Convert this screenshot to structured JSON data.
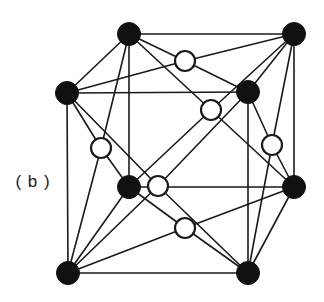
{
  "figure": {
    "panel_label": "( b )",
    "caption_text": "",
    "colors": {
      "background": "#ffffff",
      "line": "#1a1a1a",
      "filled_atom_fill": "#111111",
      "filled_atom_stroke": "#111111",
      "open_atom_fill": "#ffffff",
      "open_atom_stroke": "#1a1a1a",
      "label_color": "#1a1a1a"
    },
    "geometry": {
      "edge_stroke_width": 1.6,
      "filled_atom_radius": 11.5,
      "open_atom_radius": 10,
      "open_atom_stroke_width": 2.2
    }
  },
  "chart_data": {
    "type": "scatter",
    "title": "( b )",
    "xlabel": "",
    "ylabel": "",
    "grid": false,
    "legend": null,
    "structure": "face-centred cubic (fcc) unit cell",
    "projection": "oblique / cabinet projection of a cube",
    "atom_series": [
      {
        "name": "corner-atoms-filled",
        "marker": "filled-circle",
        "color": "#111111",
        "radius": 11.5,
        "count": 8,
        "points": [
          {
            "id": "corner-back-top-left",
            "x": 129,
            "y": 34,
            "lattice": [
              0,
              1,
              1
            ]
          },
          {
            "id": "corner-back-top-right",
            "x": 294,
            "y": 34,
            "lattice": [
              1,
              1,
              1
            ]
          },
          {
            "id": "corner-front-top-left",
            "x": 67,
            "y": 93,
            "lattice": [
              0,
              1,
              0
            ]
          },
          {
            "id": "corner-front-top-right",
            "x": 248,
            "y": 92,
            "lattice": [
              1,
              1,
              0
            ]
          },
          {
            "id": "corner-back-bottom-left",
            "x": 129,
            "y": 187,
            "lattice": [
              0,
              0,
              1
            ]
          },
          {
            "id": "corner-back-bottom-right",
            "x": 294,
            "y": 187,
            "lattice": [
              1,
              0,
              1
            ]
          },
          {
            "id": "corner-front-bottom-left",
            "x": 68,
            "y": 273,
            "lattice": [
              0,
              0,
              0
            ]
          },
          {
            "id": "corner-front-bottom-right",
            "x": 248,
            "y": 273,
            "lattice": [
              1,
              0,
              0
            ]
          }
        ]
      },
      {
        "name": "face-centre-atoms-open",
        "marker": "open-circle",
        "color": "#ffffff",
        "stroke": "#1a1a1a",
        "radius": 10,
        "count": 6,
        "points": [
          {
            "id": "face-top",
            "x": 185,
            "y": 61,
            "lattice": [
              0.5,
              1,
              0.5
            ]
          },
          {
            "id": "face-back",
            "x": 211,
            "y": 110,
            "lattice": [
              0.5,
              0.5,
              1
            ]
          },
          {
            "id": "face-left",
            "x": 101,
            "y": 148,
            "lattice": [
              0,
              0.5,
              0.5
            ]
          },
          {
            "id": "face-right",
            "x": 272,
            "y": 145,
            "lattice": [
              1,
              0.5,
              0.5
            ]
          },
          {
            "id": "face-front",
            "x": 158,
            "y": 186,
            "lattice": [
              0.5,
              0.5,
              0
            ]
          },
          {
            "id": "face-bottom",
            "x": 185,
            "y": 228,
            "lattice": [
              0.5,
              0,
              0.5
            ]
          }
        ]
      }
    ],
    "edges": [
      [
        "corner-front-top-left",
        "corner-front-top-right"
      ],
      [
        "corner-front-top-right",
        "corner-front-bottom-right"
      ],
      [
        "corner-front-bottom-right",
        "corner-front-bottom-left"
      ],
      [
        "corner-front-bottom-left",
        "corner-front-top-left"
      ],
      [
        "corner-back-top-left",
        "corner-back-top-right"
      ],
      [
        "corner-back-top-right",
        "corner-back-bottom-right"
      ],
      [
        "corner-back-bottom-right",
        "corner-back-bottom-left"
      ],
      [
        "corner-back-bottom-left",
        "corner-back-top-left"
      ],
      [
        "corner-front-top-left",
        "corner-back-top-left"
      ],
      [
        "corner-front-top-right",
        "corner-back-top-right"
      ],
      [
        "corner-front-bottom-left",
        "corner-back-bottom-left"
      ],
      [
        "corner-front-bottom-right",
        "corner-back-bottom-right"
      ]
    ],
    "bonds": [
      [
        "face-top",
        "corner-back-top-left"
      ],
      [
        "face-top",
        "corner-back-top-right"
      ],
      [
        "face-top",
        "corner-front-top-left"
      ],
      [
        "face-top",
        "corner-front-top-right"
      ],
      [
        "face-back",
        "corner-back-top-left"
      ],
      [
        "face-back",
        "corner-back-top-right"
      ],
      [
        "face-back",
        "corner-back-bottom-left"
      ],
      [
        "face-back",
        "corner-back-bottom-right"
      ],
      [
        "face-left",
        "corner-front-top-left"
      ],
      [
        "face-left",
        "corner-back-top-left"
      ],
      [
        "face-left",
        "corner-front-bottom-left"
      ],
      [
        "face-left",
        "corner-back-bottom-left"
      ],
      [
        "face-right",
        "corner-front-top-right"
      ],
      [
        "face-right",
        "corner-back-top-right"
      ],
      [
        "face-right",
        "corner-front-bottom-right"
      ],
      [
        "face-right",
        "corner-back-bottom-right"
      ],
      [
        "face-front",
        "corner-front-top-left"
      ],
      [
        "face-front",
        "corner-front-top-right"
      ],
      [
        "face-front",
        "corner-front-bottom-left"
      ],
      [
        "face-front",
        "corner-front-bottom-right"
      ],
      [
        "face-bottom",
        "corner-front-bottom-left"
      ],
      [
        "face-bottom",
        "corner-front-bottom-right"
      ],
      [
        "face-bottom",
        "corner-back-bottom-left"
      ],
      [
        "face-bottom",
        "corner-back-bottom-right"
      ]
    ]
  }
}
